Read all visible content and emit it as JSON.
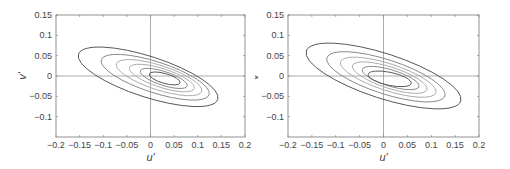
{
  "chart_data": [
    {
      "type": "contour",
      "title": "",
      "xlabel": "u'",
      "ylabel": "v'",
      "xlim": [
        -0.2,
        0.2
      ],
      "ylim": [
        -0.15,
        0.15
      ],
      "xticks": [
        "-0.2",
        "-0.15",
        "-0.1",
        "-0.05",
        "0",
        "0.05",
        "0.1",
        "0.15",
        "0.2"
      ],
      "yticks": [
        "0.15",
        "0.1",
        "0.05",
        "0",
        "-0.05",
        "-0.1"
      ],
      "grid": false,
      "crosshair": {
        "x": 0,
        "y": 0
      },
      "contours": [
        {
          "level": 1,
          "color": "#555555",
          "center": [
            -0.005,
            -0.002
          ],
          "semi_axes": [
            0.155,
            0.05
          ],
          "angle_deg": -18
        },
        {
          "level": 2,
          "color": "#888888",
          "center": [
            0.01,
            -0.003
          ],
          "semi_axes": [
            0.12,
            0.038
          ],
          "angle_deg": -18
        },
        {
          "level": 3,
          "color": "#aaaaaa",
          "center": [
            0.018,
            -0.004
          ],
          "semi_axes": [
            0.095,
            0.03
          ],
          "angle_deg": -18
        },
        {
          "level": 4,
          "color": "#aaaaaa",
          "center": [
            0.024,
            -0.005
          ],
          "semi_axes": [
            0.072,
            0.023
          ],
          "angle_deg": -18
        },
        {
          "level": 5,
          "color": "#888888",
          "center": [
            0.028,
            -0.006
          ],
          "semi_axes": [
            0.052,
            0.017
          ],
          "angle_deg": -18
        },
        {
          "level": 6,
          "color": "#555555",
          "center": [
            0.03,
            -0.006
          ],
          "semi_axes": [
            0.034,
            0.012
          ],
          "angle_deg": -16
        }
      ]
    },
    {
      "type": "contour",
      "title": "",
      "xlabel": "u'",
      "ylabel": "v'",
      "xlim": [
        -0.2,
        0.2
      ],
      "ylim": [
        -0.15,
        0.15
      ],
      "xticks": [
        "-0.2",
        "-0.15",
        "-0.1",
        "-0.05",
        "0",
        "0.05",
        "0.1",
        "0.15",
        "0.2"
      ],
      "yticks": [
        "0.15",
        "0.1",
        "0.05",
        "0",
        "-0.05",
        "-0.1"
      ],
      "grid": false,
      "crosshair": {
        "x": 0,
        "y": 0
      },
      "contours": [
        {
          "level": 1,
          "color": "#555555",
          "center": [
            0.0,
            0.0
          ],
          "semi_axes": [
            0.17,
            0.055
          ],
          "angle_deg": -18
        },
        {
          "level": 2,
          "color": "#888888",
          "center": [
            0.005,
            -0.002
          ],
          "semi_axes": [
            0.13,
            0.042
          ],
          "angle_deg": -18
        },
        {
          "level": 3,
          "color": "#aaaaaa",
          "center": [
            0.01,
            -0.003
          ],
          "semi_axes": [
            0.105,
            0.033
          ],
          "angle_deg": -18
        },
        {
          "level": 4,
          "color": "#aaaaaa",
          "center": [
            0.013,
            -0.004
          ],
          "semi_axes": [
            0.082,
            0.026
          ],
          "angle_deg": -18
        },
        {
          "level": 5,
          "color": "#888888",
          "center": [
            0.015,
            -0.005
          ],
          "semi_axes": [
            0.062,
            0.02
          ],
          "angle_deg": -17
        },
        {
          "level": 6,
          "color": "#555555",
          "center": [
            0.013,
            -0.007
          ],
          "semi_axes": [
            0.046,
            0.016
          ],
          "angle_deg": -12
        }
      ]
    }
  ]
}
